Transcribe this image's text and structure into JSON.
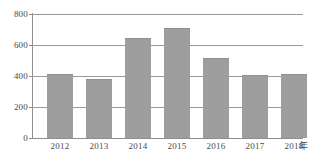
{
  "chart_data": {
    "type": "bar",
    "title": "",
    "subtitle": "",
    "xlabel": "年",
    "ylabel": "",
    "categories": [
      "2012",
      "2013",
      "2014",
      "2015",
      "2016",
      "2017",
      "2018"
    ],
    "values": [
      410,
      383,
      645,
      713,
      515,
      405,
      415
    ],
    "series": [
      {
        "name": "",
        "values": [
          410,
          383,
          645,
          713,
          515,
          405,
          415
        ]
      }
    ],
    "ylim": [
      0,
      800
    ],
    "yticks": [
      0,
      200,
      400,
      600,
      800
    ],
    "ytick_labels": [
      "0",
      "200",
      "400",
      "600",
      "800"
    ],
    "grid": true,
    "grid_axis": "y",
    "legend": false,
    "legend_position": "none",
    "bar_color": "#9e9e9e",
    "grid_color": "#9a9a9a",
    "axis_color": "#8e8e8e",
    "text_color": "#4a4a4a",
    "background": "#ffffff"
  },
  "axes": {
    "x_unit_label": "年",
    "y_tick_labels": [
      "800",
      "600",
      "400",
      "200",
      "0"
    ]
  }
}
